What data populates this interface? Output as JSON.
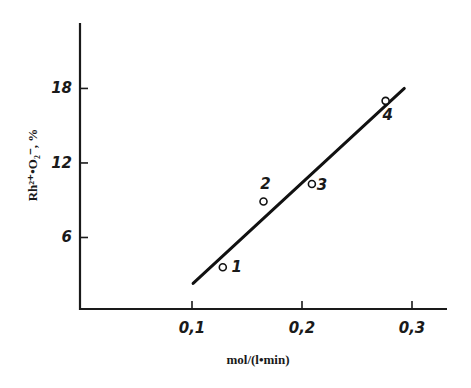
{
  "chart_data": {
    "type": "scatter",
    "title": "",
    "xlabel": "mol/(l•min)",
    "ylabel": "Rh²⁺•O₂⁻, %",
    "xlim": [
      0,
      0.33
    ],
    "ylim": [
      0,
      22
    ],
    "x_ticks": [
      0.1,
      0.2,
      0.3
    ],
    "x_tick_labels": [
      "0,1",
      "0,2",
      "0,3"
    ],
    "y_ticks": [
      6,
      12,
      18
    ],
    "y_tick_labels": [
      "6",
      "12",
      "18"
    ],
    "grid": false,
    "legend": null,
    "series": [
      {
        "name": "measured",
        "marker": "open-circle",
        "points": [
          {
            "label": "1",
            "x": 0.128,
            "y": 3.6
          },
          {
            "label": "2",
            "x": 0.165,
            "y": 8.9
          },
          {
            "label": "3",
            "x": 0.209,
            "y": 10.3
          },
          {
            "label": "4",
            "x": 0.276,
            "y": 17.0
          }
        ]
      },
      {
        "name": "fit-line",
        "type": "line",
        "points": [
          {
            "x": 0.101,
            "y": 2.3
          },
          {
            "x": 0.293,
            "y": 18.0
          }
        ]
      }
    ]
  }
}
